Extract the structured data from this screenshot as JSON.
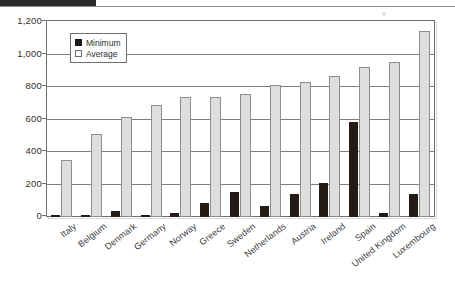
{
  "chart_data": {
    "type": "bar",
    "title": "",
    "subtitle": "",
    "xlabel": "",
    "ylabel": "",
    "ylim": [
      0,
      1200
    ],
    "yticks": [
      0,
      200,
      400,
      600,
      800,
      1000,
      1200
    ],
    "ytick_labels": [
      "0",
      "200",
      "400",
      "600",
      "800",
      "1,000",
      "1,200"
    ],
    "grid": true,
    "legend_position": "upper-left-inside",
    "categories": [
      "Italy",
      "Belgium",
      "Denmark",
      "Germany",
      "Norway",
      "Greece",
      "Sweden",
      "Netherlands",
      "Austria",
      "Ireland",
      "Spain",
      "United Kingdom",
      "Luxembourg"
    ],
    "series": [
      {
        "name": "Minimum",
        "color": "#241b17",
        "values": [
          12,
          10,
          35,
          15,
          25,
          85,
          155,
          70,
          145,
          210,
          590,
          25,
          140
        ]
      },
      {
        "name": "Average",
        "color": "#dededc",
        "values": [
          350,
          515,
          620,
          690,
          745,
          745,
          760,
          815,
          835,
          875,
          930,
          960,
          1150
        ]
      }
    ]
  },
  "legend": {
    "items": [
      {
        "label": "Minimum",
        "swatch": "filled-square-icon"
      },
      {
        "label": "Average",
        "swatch": "outline-square-icon"
      }
    ]
  },
  "colors": {
    "minimum": "#241b17",
    "average": "#dededc",
    "axis": "#6e6e6e",
    "grid": "#7d7d7d",
    "text": "#2e2e2e"
  }
}
